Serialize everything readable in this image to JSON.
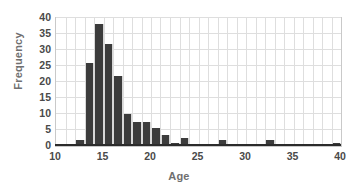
{
  "chart_data": {
    "type": "bar",
    "title": "",
    "subtitle": "",
    "xlabel": "Age",
    "ylabel": "Frequency",
    "xlim": [
      10,
      40
    ],
    "ylim": [
      0,
      40
    ],
    "grid": true,
    "legend": null,
    "bin_width": 1,
    "bar_color": "#3c3c3c",
    "grid_color": "#dedede",
    "axis_color": "#2b2b2b",
    "tick_text_color": "#4a4a4a",
    "label_text_color": "#6f6f6f",
    "background": "#ffffff",
    "xticks": [
      10,
      15,
      20,
      25,
      30,
      35,
      40
    ],
    "xtick_labels": [
      "10",
      "15",
      "20",
      "25",
      "30",
      "35",
      "40"
    ],
    "yticks": [
      0,
      5,
      10,
      15,
      20,
      25,
      30,
      35,
      40
    ],
    "ytick_labels": [
      "0",
      "5",
      "10",
      "15",
      "20",
      "25",
      "30",
      "35",
      "40"
    ],
    "categories": [
      10,
      11,
      12,
      13,
      14,
      15,
      16,
      17,
      18,
      19,
      20,
      21,
      22,
      23,
      24,
      25,
      26,
      27,
      28,
      29,
      30,
      31,
      32,
      33,
      34,
      35,
      36,
      37,
      38,
      39
    ],
    "values": [
      0,
      0,
      2,
      26,
      38,
      32,
      22,
      10,
      7.5,
      7.5,
      5.5,
      3.5,
      1,
      2.5,
      0,
      0,
      0,
      2,
      0,
      0,
      0,
      0,
      2,
      0,
      0,
      0,
      0,
      0,
      0,
      1
    ]
  }
}
